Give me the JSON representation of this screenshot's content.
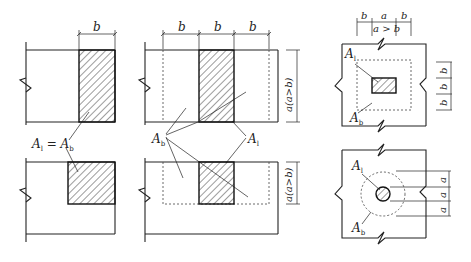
{
  "figure": {
    "panel_left": {
      "dim_top": "b",
      "label": "A_l = A_b",
      "label_parts": {
        "A1": "A",
        "sub1": "l",
        "eq": " = ",
        "A2": "A",
        "sub2": "b"
      }
    },
    "panel_middle": {
      "dim_top": [
        "b",
        "b",
        "b"
      ],
      "dim_right_top": "a(a>b)",
      "dim_right_bottom": "a(a>b)",
      "label_Ab": {
        "A": "A",
        "sub": "b"
      },
      "label_Al": {
        "A": "A",
        "sub": "l"
      }
    },
    "panel_right_top": {
      "dim_top": [
        "b",
        "a",
        "b"
      ],
      "dim_top_note": "a > b",
      "dim_right": [
        "b",
        "b",
        "b"
      ],
      "label_Al": {
        "A": "A",
        "sub": "l"
      },
      "label_Ab": {
        "A": "A",
        "sub": "b"
      }
    },
    "panel_right_bottom": {
      "dim_right": [
        "a",
        "a",
        "a"
      ],
      "label_Al": {
        "A": "A",
        "sub": "l"
      },
      "label_Ab": {
        "A": "A",
        "sub": "b"
      }
    }
  }
}
